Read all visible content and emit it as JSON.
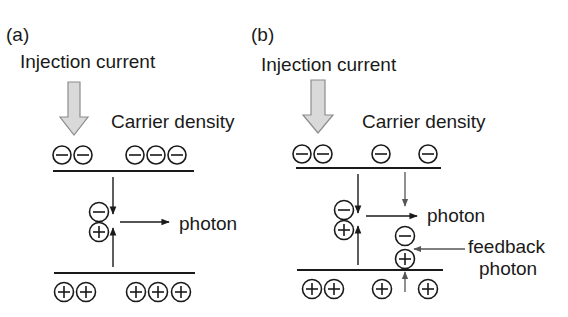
{
  "panels": {
    "a": {
      "label": "(a)",
      "injection_label": "Injection current",
      "carrier_label": "Carrier density",
      "photon_label": "photon",
      "top_charges": [
        "−",
        "−",
        "−",
        "−",
        "−"
      ],
      "bottom_charges": [
        "+",
        "+",
        "+",
        "+",
        "+"
      ]
    },
    "b": {
      "label": "(b)",
      "injection_label": "Injection current",
      "carrier_label": "Carrier density",
      "photon_label": "photon",
      "feedback_label_line1": "feedback",
      "feedback_label_line2": "photon",
      "top_charges": [
        "−",
        "−",
        "−",
        "−"
      ],
      "bottom_charges": [
        "+",
        "+",
        "+",
        "+"
      ]
    }
  },
  "colors": {
    "ink": "#1a1a1a",
    "arrow_fill": "#d9d9d9",
    "arrow_stroke": "#8c8c8c",
    "feedback_arrow": "#555555",
    "background": "#ffffff"
  }
}
